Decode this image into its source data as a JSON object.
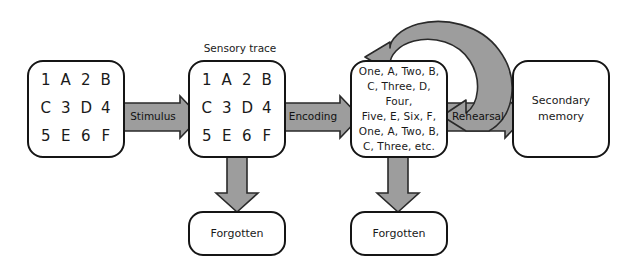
{
  "diagram": {
    "colors": {
      "arrow_fill": "#9d9d9d",
      "arrow_stroke": "#2a2a2a",
      "node_stroke": "#151515",
      "node_fill": "#ffffff",
      "text": "#1a1a1a",
      "background": "#ffffff"
    },
    "captions": [
      {
        "id": "sensory-trace-caption",
        "text": "Sensory trace"
      }
    ],
    "nodes": [
      {
        "id": "stimulus-display",
        "type": "grid",
        "rows": [
          [
            "1",
            "A",
            "2",
            "B"
          ],
          [
            "C",
            "3",
            "D",
            "4"
          ],
          [
            "5",
            "E",
            "6",
            "F"
          ]
        ]
      },
      {
        "id": "sensory-trace",
        "type": "grid",
        "rows": [
          [
            "1",
            "A",
            "2",
            "B"
          ],
          [
            "C",
            "3",
            "D",
            "4"
          ],
          [
            "5",
            "E",
            "6",
            "F"
          ]
        ]
      },
      {
        "id": "primary-memory",
        "type": "list",
        "lines": [
          "One, A, Two, B,",
          "C, Three, D, Four,",
          "Five, E, Six, F,",
          "One, A, Two, B,",
          "C, Three, etc."
        ]
      },
      {
        "id": "secondary-memory",
        "type": "plain",
        "lines": [
          "Secondary",
          "memory"
        ]
      },
      {
        "id": "forgotten-sensory",
        "type": "plain",
        "lines": [
          "Forgotten"
        ]
      },
      {
        "id": "forgotten-primary",
        "type": "plain",
        "lines": [
          "Forgotten"
        ]
      }
    ],
    "arrows": [
      {
        "id": "stimulus-arrow",
        "label": "Stimulus",
        "from": "stimulus-display",
        "to": "sensory-trace",
        "direction": "right"
      },
      {
        "id": "encoding-arrow",
        "label": "Encoding",
        "from": "sensory-trace",
        "to": "primary-memory",
        "direction": "right"
      },
      {
        "id": "rehearsal-arrow",
        "label": "Rehearsal",
        "from": "primary-memory",
        "to": "secondary-memory",
        "direction": "right"
      },
      {
        "id": "rehearsal-loop",
        "label": "",
        "from": "primary-memory",
        "to": "primary-memory",
        "direction": "loop"
      },
      {
        "id": "forget-sensory-arrow",
        "label": "",
        "from": "sensory-trace",
        "to": "forgotten-sensory",
        "direction": "down"
      },
      {
        "id": "forget-primary-arrow",
        "label": "",
        "from": "primary-memory",
        "to": "forgotten-primary",
        "direction": "down"
      }
    ]
  }
}
